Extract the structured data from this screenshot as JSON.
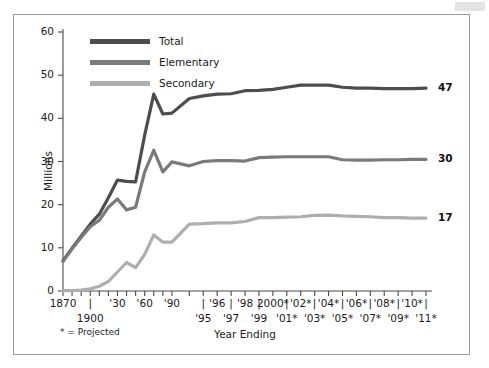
{
  "figure": {
    "footnote": "* = Projected",
    "end_labels": [
      {
        "name": "total",
        "text": "47",
        "value": 47
      },
      {
        "name": "elementary",
        "text": "30",
        "value": 30
      },
      {
        "name": "secondary",
        "text": "17",
        "value": 17
      }
    ]
  },
  "colors": {
    "total": "#4d4d4d",
    "elementary": "#7a7a7a",
    "secondary": "#aeaeae",
    "axis": "#4a4a4a",
    "text": "#1a1a1a",
    "frame": "#9a9a9a",
    "background": "#ffffff"
  },
  "chart_data": {
    "type": "line",
    "title": "",
    "subtitle": "",
    "xlabel": "Year Ending",
    "ylabel": "Millions",
    "ylim": [
      0,
      60
    ],
    "yticks": [
      0,
      10,
      20,
      30,
      40,
      50,
      60
    ],
    "ytick_labels": [
      "0",
      "10",
      "20",
      "30",
      "40",
      "50",
      "60"
    ],
    "grid": false,
    "legend_position": "top-left",
    "legend": [
      "Total",
      "Elementary",
      "Secondary"
    ],
    "annotations": [
      "* = Projected"
    ],
    "x_axis_rows": {
      "upper": [
        {
          "label": "1870",
          "x": 1870
        },
        {
          "label": "|",
          "x": 1900
        },
        {
          "label": "'30",
          "x": 1930
        },
        {
          "label": "'60",
          "x": 1960
        },
        {
          "label": "'90",
          "x": 1990
        },
        {
          "label": "|",
          "x": 1995
        },
        {
          "label": "'96",
          "x": 1996
        },
        {
          "label": "|",
          "x": 1997
        },
        {
          "label": "'98",
          "x": 1998
        },
        {
          "label": "|",
          "x": 1999
        },
        {
          "label": "2000*",
          "x": 2000
        },
        {
          "label": "|",
          "x": 2001
        },
        {
          "label": "'02*",
          "x": 2002
        },
        {
          "label": "|",
          "x": 2003
        },
        {
          "label": "'04*",
          "x": 2004
        },
        {
          "label": "|",
          "x": 2005
        },
        {
          "label": "'06*",
          "x": 2006
        },
        {
          "label": "|",
          "x": 2007
        },
        {
          "label": "'08*",
          "x": 2008
        },
        {
          "label": "|",
          "x": 2009
        },
        {
          "label": "'10*",
          "x": 2010
        },
        {
          "label": "|",
          "x": 2011
        }
      ],
      "lower": [
        {
          "label": "1900",
          "x": 1900
        },
        {
          "label": "'95",
          "x": 1995
        },
        {
          "label": "'97",
          "x": 1997
        },
        {
          "label": "'99",
          "x": 1999
        },
        {
          "label": "'01*",
          "x": 2001
        },
        {
          "label": "'03*",
          "x": 2003
        },
        {
          "label": "'05*",
          "x": 2005
        },
        {
          "label": "'07*",
          "x": 2007
        },
        {
          "label": "'09*",
          "x": 2009
        },
        {
          "label": "'11*",
          "x": 2011
        }
      ]
    },
    "xticks": [
      1870,
      1880,
      1890,
      1900,
      1910,
      1920,
      1930,
      1940,
      1950,
      1960,
      1970,
      1980,
      1990,
      1994,
      1995,
      1996,
      1997,
      1998,
      1999,
      2000,
      2001,
      2002,
      2003,
      2004,
      2005,
      2006,
      2007,
      2008,
      2009,
      2010,
      2011
    ],
    "x": [
      1870,
      1880,
      1890,
      1900,
      1910,
      1920,
      1930,
      1940,
      1950,
      1960,
      1970,
      1980,
      1990,
      1994,
      1995,
      1996,
      1997,
      1998,
      1999,
      2000,
      2001,
      2002,
      2003,
      2004,
      2005,
      2006,
      2007,
      2008,
      2009,
      2010,
      2011
    ],
    "series": [
      {
        "name": "Total",
        "color": "#4d4d4d",
        "values": [
          7.0,
          9.9,
          12.7,
          15.5,
          17.8,
          21.6,
          25.7,
          25.4,
          25.3,
          36.1,
          45.6,
          41.0,
          41.2,
          44.6,
          45.2,
          45.6,
          45.7,
          46.4,
          46.5,
          46.7,
          47.2,
          47.7,
          47.7,
          47.7,
          47.2,
          47.0,
          47.0,
          46.9,
          46.9,
          46.9,
          47.0
        ]
      },
      {
        "name": "Elementary",
        "color": "#7a7a7a",
        "values": [
          6.9,
          9.8,
          12.4,
          14.9,
          16.4,
          19.4,
          21.3,
          18.8,
          19.4,
          27.6,
          32.6,
          27.6,
          29.9,
          29.0,
          30.0,
          30.2,
          30.2,
          30.1,
          30.9,
          31.0,
          31.1,
          31.1,
          31.1,
          31.1,
          30.4,
          30.3,
          30.3,
          30.4,
          30.4,
          30.5,
          30.5
        ]
      },
      {
        "name": "Secondary",
        "color": "#aeaeae",
        "values": [
          0.1,
          0.1,
          0.2,
          0.5,
          1.1,
          2.2,
          4.4,
          6.6,
          5.4,
          8.5,
          13.0,
          11.3,
          11.3,
          15.5,
          15.6,
          15.8,
          15.8,
          16.1,
          17.0,
          17.0,
          17.1,
          17.2,
          17.5,
          17.6,
          17.4,
          17.3,
          17.2,
          17.0,
          17.0,
          16.9,
          16.9
        ]
      }
    ]
  }
}
